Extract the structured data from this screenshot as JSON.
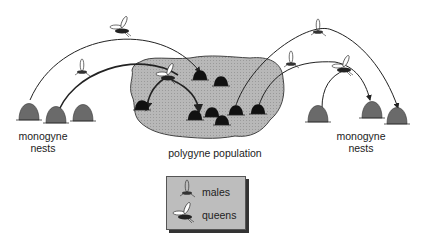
{
  "diagram": {
    "labels": {
      "left_nests": [
        "monogyne",
        "nests"
      ],
      "right_nests": [
        "monogyne",
        "nests"
      ],
      "center": "polygyne population"
    },
    "legend": {
      "items": [
        {
          "icon": "male-ant-icon",
          "label": "males"
        },
        {
          "icon": "queen-ant-icon",
          "label": "queens"
        }
      ]
    },
    "colors": {
      "population_fill": "#b5b5b5",
      "nest_dark": "#111111",
      "nest_grey": "#6a6a6a",
      "line": "#222222"
    }
  }
}
